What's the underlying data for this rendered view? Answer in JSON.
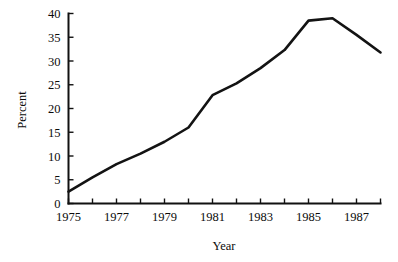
{
  "chart_data": {
    "type": "line",
    "title": "",
    "xlabel": "Year",
    "ylabel": "Percent",
    "x": [
      1975,
      1976,
      1977,
      1978,
      1979,
      1980,
      1981,
      1982,
      1983,
      1984,
      1985,
      1986,
      1987,
      1988
    ],
    "values": [
      2.5,
      5.5,
      8.3,
      10.5,
      13.0,
      16.0,
      22.8,
      25.3,
      28.5,
      32.3,
      38.5,
      39.0,
      35.5,
      31.8
    ],
    "series": [
      {
        "name": "Percent",
        "values": [
          2.5,
          5.5,
          8.3,
          10.5,
          13.0,
          16.0,
          22.8,
          25.3,
          28.5,
          32.3,
          38.5,
          39.0,
          35.5,
          31.8
        ]
      }
    ],
    "xlim": [
      1975,
      1988
    ],
    "ylim": [
      0,
      40
    ],
    "y_ticks": [
      0,
      5,
      10,
      15,
      20,
      25,
      30,
      35,
      40
    ],
    "y_tick_labels": [
      "0",
      "5",
      "10",
      "15",
      "20",
      "25",
      "30",
      "35",
      "40"
    ],
    "x_ticks": [
      1975,
      1976,
      1977,
      1978,
      1979,
      1980,
      1981,
      1982,
      1983,
      1984,
      1985,
      1986,
      1987,
      1988
    ],
    "x_tick_labels": [
      "1975",
      "",
      "1977",
      "",
      "1979",
      "",
      "1981",
      "",
      "1983",
      "",
      "1985",
      "",
      "1987",
      ""
    ],
    "x_labeled_ticks": [
      {
        "value": 1975,
        "label": "1975"
      },
      {
        "value": 1977,
        "label": "1977"
      },
      {
        "value": 1979,
        "label": "1979"
      },
      {
        "value": 1981,
        "label": "1981"
      },
      {
        "value": 1983,
        "label": "1983"
      },
      {
        "value": 1985,
        "label": "1985"
      },
      {
        "value": 1987,
        "label": "1987"
      }
    ],
    "grid": false,
    "legend": false,
    "legend_position": "none",
    "line_color": "#131313",
    "axis_color": "#111111",
    "background_color": "#ffffff"
  }
}
